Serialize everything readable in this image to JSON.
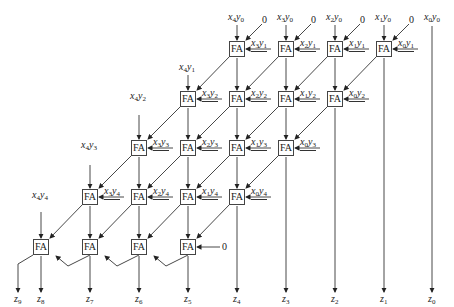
{
  "diagram": {
    "title": "",
    "cell_label": "FA",
    "rows": [
      {
        "top": [
          {
            "x": "x",
            "xi": "4",
            "y": "y",
            "yi": "0"
          },
          {
            "x": "x",
            "xi": "3",
            "y": "y",
            "yi": "0"
          },
          {
            "x": "x",
            "xi": "2",
            "y": "y",
            "yi": "0"
          },
          {
            "x": "x",
            "xi": "1",
            "y": "y",
            "yi": "0"
          }
        ],
        "side": [
          {
            "x": "x",
            "xi": "3",
            "y": "y",
            "yi": "1"
          },
          {
            "x": "x",
            "xi": "2",
            "y": "y",
            "yi": "1"
          },
          {
            "x": "x",
            "xi": "1",
            "y": "y",
            "yi": "1"
          },
          {
            "x": "x",
            "xi": "0",
            "y": "y",
            "yi": "1"
          }
        ]
      },
      {
        "top": {
          "x": "x",
          "xi": "4",
          "y": "y",
          "yi": "1"
        },
        "side": [
          {
            "x": "x",
            "xi": "3",
            "y": "y",
            "yi": "2"
          },
          {
            "x": "x",
            "xi": "2",
            "y": "y",
            "yi": "2"
          },
          {
            "x": "x",
            "xi": "1",
            "y": "y",
            "yi": "2"
          },
          {
            "x": "x",
            "xi": "0",
            "y": "y",
            "yi": "2"
          }
        ]
      },
      {
        "top": {
          "x": "x",
          "xi": "4",
          "y": "y",
          "yi": "2"
        },
        "side": [
          {
            "x": "x",
            "xi": "3",
            "y": "y",
            "yi": "3"
          },
          {
            "x": "x",
            "xi": "2",
            "y": "y",
            "yi": "3"
          },
          {
            "x": "x",
            "xi": "1",
            "y": "y",
            "yi": "3"
          },
          {
            "x": "x",
            "xi": "0",
            "y": "y",
            "yi": "3"
          }
        ]
      },
      {
        "top": {
          "x": "x",
          "xi": "4",
          "y": "y",
          "yi": "3"
        },
        "side": [
          {
            "x": "x",
            "xi": "3",
            "y": "y",
            "yi": "4"
          },
          {
            "x": "x",
            "xi": "2",
            "y": "y",
            "yi": "4"
          },
          {
            "x": "x",
            "xi": "1",
            "y": "y",
            "yi": "4"
          },
          {
            "x": "x",
            "xi": "0",
            "y": "y",
            "yi": "4"
          }
        ]
      },
      {
        "top": {
          "x": "x",
          "xi": "4",
          "y": "y",
          "yi": "4"
        }
      }
    ],
    "x0y0": {
      "x": "x",
      "xi": "0",
      "y": "y",
      "yi": "0"
    },
    "zero": "0",
    "outputs": [
      {
        "z": "z",
        "i": "9"
      },
      {
        "z": "z",
        "i": "8"
      },
      {
        "z": "z",
        "i": "7"
      },
      {
        "z": "z",
        "i": "6"
      },
      {
        "z": "z",
        "i": "5"
      },
      {
        "z": "z",
        "i": "4"
      },
      {
        "z": "z",
        "i": "3"
      },
      {
        "z": "z",
        "i": "2"
      },
      {
        "z": "z",
        "i": "1"
      },
      {
        "z": "z",
        "i": "0"
      }
    ]
  }
}
